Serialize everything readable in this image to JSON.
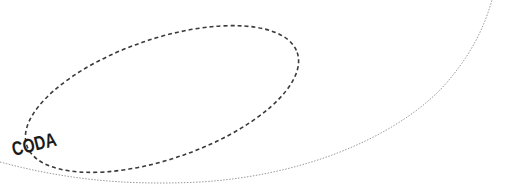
{
  "diagram": {
    "region_label": "CODA",
    "colors": {
      "background": "#ffffff",
      "ellipse_stroke": "#3a3a3a",
      "curve_stroke": "#9a9a9a",
      "label": "#1a1a1a"
    }
  }
}
